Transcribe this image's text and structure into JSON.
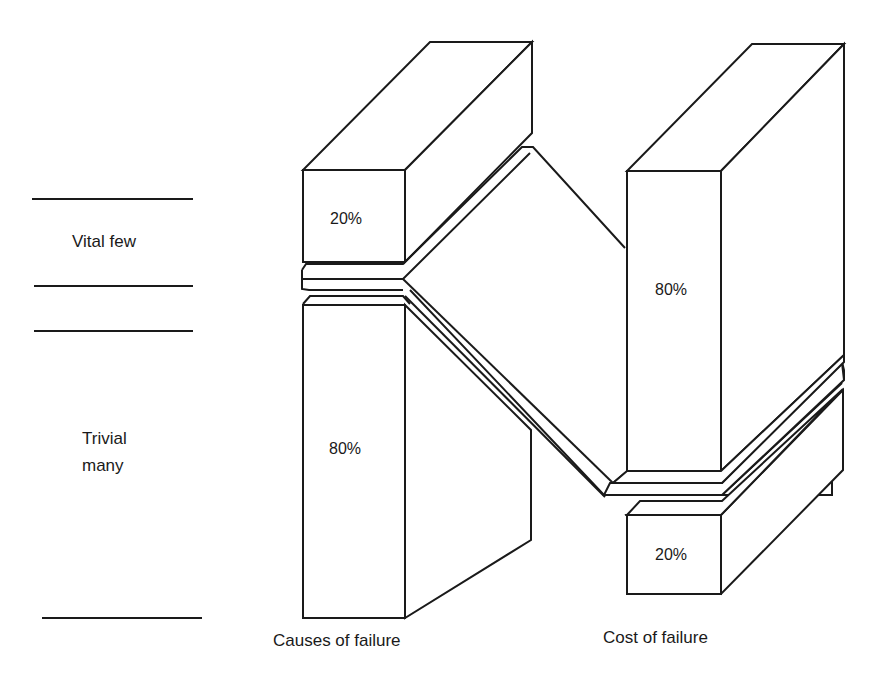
{
  "diagram": {
    "type": "pareto-80-20",
    "left_labels": {
      "vital_few": "Vital few",
      "trivial_many_line1": "Trivial",
      "trivial_many_line2": "many"
    },
    "columns": [
      {
        "label": "Causes of failure",
        "segments": [
          {
            "name": "vital few",
            "value": "20%"
          },
          {
            "name": "trivial many",
            "value": "80%"
          }
        ]
      },
      {
        "label": "Cost of failure",
        "segments": [
          {
            "name": "vital few",
            "value": "80%"
          },
          {
            "name": "trivial many",
            "value": "20%"
          }
        ]
      }
    ],
    "line_color": "#1a1a1a",
    "background": "#ffffff"
  }
}
